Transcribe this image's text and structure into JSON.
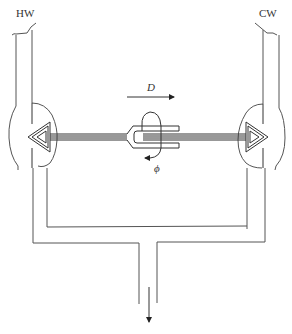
{
  "diagram": {
    "title": "",
    "labels": {
      "hot_water": "HW",
      "cold_water": "CW",
      "displacement": "D",
      "rotation": "ϕ"
    },
    "components": [
      {
        "id": "hot-water-inlet",
        "label": "HW",
        "position": "top-left"
      },
      {
        "id": "cold-water-inlet",
        "label": "CW",
        "position": "top-right"
      },
      {
        "id": "hot-valve-seat",
        "shape": "triangle-pointing-left",
        "position": "left"
      },
      {
        "id": "cold-valve-seat",
        "shape": "triangle-pointing-right",
        "position": "right"
      },
      {
        "id": "connecting-rod",
        "position": "center-horizontal"
      },
      {
        "id": "fork-coupling",
        "position": "center"
      },
      {
        "id": "mixing-manifold",
        "position": "lower-loop"
      },
      {
        "id": "outlet",
        "position": "bottom-center"
      }
    ],
    "arrows": [
      {
        "id": "displacement-arrow",
        "label": "D",
        "direction": "right"
      },
      {
        "id": "rotation-arrow",
        "label": "ϕ",
        "direction": "counter-clockwise"
      },
      {
        "id": "outflow-arrow",
        "label": "",
        "direction": "down"
      }
    ],
    "colors": {
      "line": "#555555",
      "text": "#333333",
      "background": "#ffffff"
    }
  }
}
